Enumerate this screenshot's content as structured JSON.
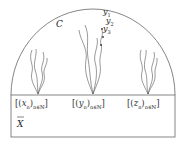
{
  "diagram": {
    "dome_label": "C",
    "space_label": "X",
    "sequence_points": [
      {
        "label_open": "[(",
        "var": "x",
        "sub_n": "n",
        "close": ")",
        "index": "n∈ℕ",
        "end": "]"
      },
      {
        "label_open": "[(",
        "var": "y",
        "sub_n": "n",
        "close": ")",
        "index": "n∈ℕ",
        "end": "]"
      },
      {
        "label_open": "[(",
        "var": "z",
        "sub_n": "n",
        "close": ")",
        "index": "n∈ℕ",
        "end": "]"
      }
    ],
    "chain_labels": [
      "y1",
      "y2",
      "y3"
    ],
    "colors": {
      "stroke": "#555555",
      "text": "#222222"
    }
  }
}
